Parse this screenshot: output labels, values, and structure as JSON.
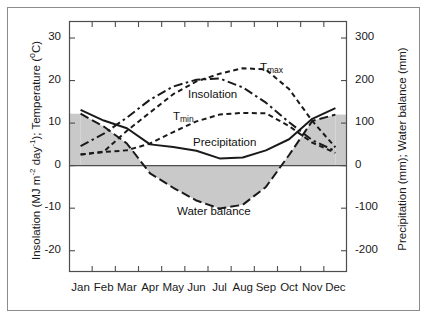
{
  "chart_data": {
    "type": "line",
    "title": "",
    "xlabel": "",
    "ylabel_left": "Insolation (MJ m-2 day-1); Temperature (oC)",
    "ylabel_right": "Precipitation (mm); Water balance (mm)",
    "categories": [
      "Jan",
      "Feb",
      "Mar",
      "Apr",
      "May",
      "Jun",
      "Jul",
      "Aug",
      "Sep",
      "Oct",
      "Nov",
      "Dec"
    ],
    "ylim_left": [
      -25,
      34
    ],
    "ylim_right": [
      -250,
      340
    ],
    "yticks_left": [
      "30",
      "20",
      "10",
      "0",
      "-10",
      "-20"
    ],
    "yticks_left_values": [
      30,
      20,
      10,
      0,
      -10,
      -20
    ],
    "yticks_right": [
      "300",
      "200",
      "100",
      "0",
      "-100",
      "-200"
    ],
    "yticks_right_values": [
      300,
      200,
      100,
      0,
      -100,
      -200
    ],
    "grid": false,
    "legend": "inline-annotations",
    "series": [
      {
        "name": "Tmax",
        "label": "T",
        "label_sub": "max",
        "axis": "left",
        "style": "dashed",
        "units": "degC",
        "values": [
          2.6,
          3.3,
          8.2,
          12.5,
          16.8,
          19.8,
          21.6,
          22.9,
          22.6,
          18.0,
          10.5,
          4.3
        ]
      },
      {
        "name": "Tmin",
        "label": "T",
        "label_sub": "min",
        "axis": "left",
        "style": "dashed",
        "units": "degC",
        "values": [
          2.6,
          3.2,
          3.6,
          5.2,
          7.9,
          10.4,
          12.0,
          12.4,
          12.3,
          9.3,
          5.4,
          3.0
        ]
      },
      {
        "name": "Insolation",
        "label": "Insolation",
        "axis": "left",
        "style": "dash-dot",
        "units": "MJ m-2 day-1",
        "values": [
          4.6,
          7.5,
          11.3,
          15.5,
          18.6,
          20.2,
          20.5,
          18.4,
          14.8,
          10.2,
          6.0,
          3.4
        ]
      },
      {
        "name": "Precipitation",
        "label": "Precipitation",
        "axis": "right",
        "style": "solid",
        "units": "mm",
        "values": [
          131,
          106,
          88,
          50,
          44,
          35,
          17,
          19,
          36,
          62,
          110,
          135
        ]
      },
      {
        "name": "Water balance",
        "label": "Water balance",
        "axis": "right",
        "style": "long-dash",
        "units": "mm",
        "values": [
          122,
          92,
          52,
          -18,
          -52,
          -82,
          -101,
          -92,
          -50,
          25,
          105,
          120
        ]
      }
    ],
    "shaded_region": {
      "description": "area between water balance curve and zero line",
      "color": "#c9c9c9"
    },
    "colors": {
      "line": "#1a1a1a",
      "shade": "#c9c9c9",
      "axis": "#4d4d4d",
      "border": "#8c8c8c",
      "background": "#ffffff"
    }
  },
  "plot_area": {
    "left": 69,
    "top": 21,
    "right": 347,
    "bottom": 272
  }
}
